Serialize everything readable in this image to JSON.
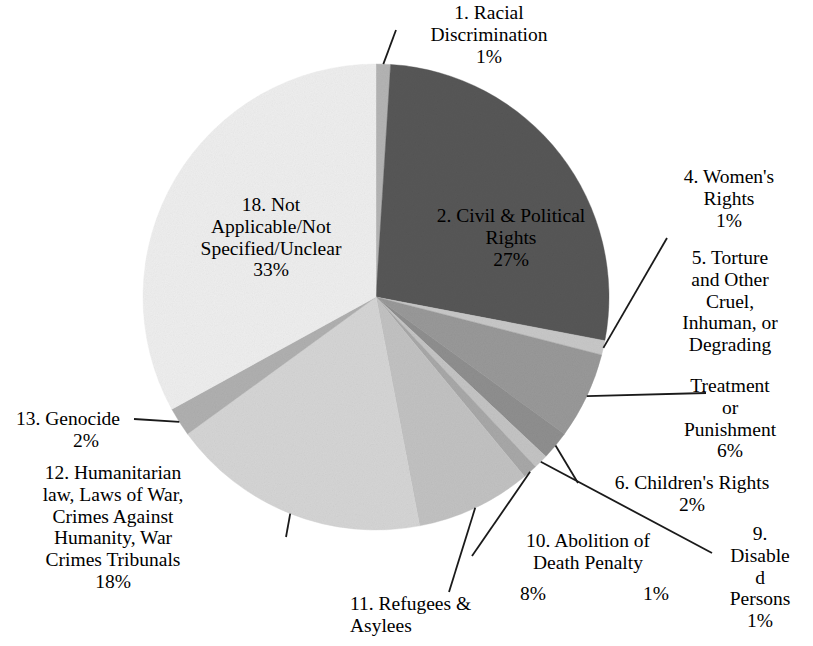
{
  "chart_data": {
    "type": "pie",
    "title": "",
    "unit": "%",
    "start_angle_deg": -90,
    "direction": "clockwise",
    "center": {
      "x": 376,
      "y": 297
    },
    "radius": 233,
    "categories": [
      "1. Racial Discrimination",
      "2. Civil & Political Rights",
      "4. Women's Rights",
      "5. Torture and Other Cruel, Inhuman, or Degrading Treatment or Punishment",
      "6. Children's Rights",
      "9. Disabled Persons",
      "10. Abolition of Death Penalty",
      "11. Refugees & Asylees",
      "12. Humanitarian law, Laws of War, Crimes Against Humanity, War Crimes Tribunals",
      "13. Genocide",
      "18. Not Applicable/Not Specified/Unclear"
    ],
    "values": [
      1,
      27,
      1,
      6,
      2,
      1,
      1,
      8,
      18,
      2,
      33
    ],
    "slices": [
      {
        "id": "1",
        "label": "1. Racial Discrimination",
        "value": 1,
        "value_text": "1%",
        "color": "#b4b4b4"
      },
      {
        "id": "2",
        "label": "2. Civil & Political Rights",
        "value": 27,
        "value_text": "27%",
        "color": "#575757"
      },
      {
        "id": "4",
        "label": "4. Women's Rights",
        "value": 1,
        "value_text": "1%",
        "color": "#c8c8c8"
      },
      {
        "id": "5",
        "label": "5. Torture and Other Cruel, Inhuman, or Degrading Treatment or Punishment",
        "value": 6,
        "value_text": "6%",
        "color": "#999999"
      },
      {
        "id": "6",
        "label": "6. Children's Rights",
        "value": 2,
        "value_text": "2%",
        "color": "#8f8f8f"
      },
      {
        "id": "9",
        "label": "9. Disabled Persons",
        "value": 1,
        "value_text": "1%",
        "color": "#c4c4c4"
      },
      {
        "id": "10",
        "label": "10. Abolition of Death Penalty",
        "value": 1,
        "value_text": "1%",
        "color": "#a8a8a8"
      },
      {
        "id": "11",
        "label": "11. Refugees & Asylees",
        "value": 8,
        "value_text": "8%",
        "color": "#c2c2c2"
      },
      {
        "id": "12",
        "label": "12. Humanitarian law, Laws of War, Crimes Against Humanity, War Crimes Tribunals",
        "value": 18,
        "value_text": "18%",
        "color": "#d5d5d5"
      },
      {
        "id": "13",
        "label": "13. Genocide",
        "value": 2,
        "value_text": "2%",
        "color": "#b0b0b0"
      },
      {
        "id": "18",
        "label": "18. Not Applicable/Not Specified/Unclear",
        "value": 33,
        "value_text": "33%",
        "color": "#eeeeee"
      }
    ],
    "legend": "none",
    "grid": false
  },
  "labels": {
    "racial_discrimination": "1.  Racial\nDiscrimination\n1%",
    "civil_political": "2.  Civil & Political\nRights\n27%",
    "womens_rights": "4.  Women's\nRights\n1%",
    "torture_part1": "5.  Torture\nand Other\nCruel,\nInhuman, or\nDegrading",
    "torture_part2": "Treatment\nor\nPunishment\n6%",
    "childrens_rights": "6. Children's Rights\n2%",
    "disabled_persons": "9.\nDisable\nd\nPersons\n1%",
    "abolition_death_penalty": "10. Abolition of\nDeath Penalty",
    "abolition_pct": "1%",
    "refugees_asylees": "11. Refugees &\nAsylees",
    "refugees_pct": "8%",
    "humanitarian_law": "12. Humanitarian\nlaw, Laws of War,\nCrimes Against\nHumanity, War\nCrimes Tribunals\n18%",
    "genocide": "13. Genocide",
    "genocide_pct": "2%",
    "not_applicable": "18. Not\nApplicable/Not\nSpecified/Unclear\n33%"
  },
  "style": {
    "background": "#ffffff",
    "leader_line_color": "#1a1a1a",
    "text_color": "#000000"
  }
}
